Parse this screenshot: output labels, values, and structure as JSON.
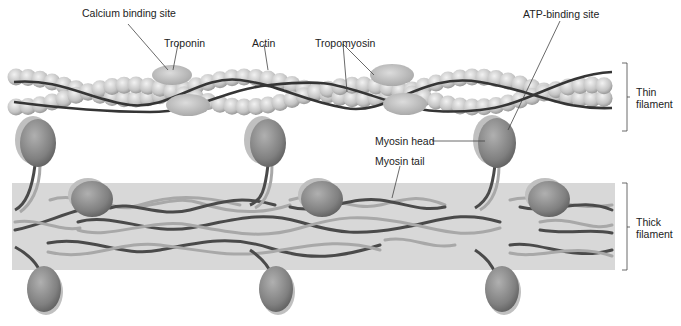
{
  "labels": {
    "calcium_binding_site": "Calcium binding site",
    "troponin": "Troponin",
    "actin": "Actin",
    "tropomyosin": "Tropomyosin",
    "atp_binding_site": "ATP-binding site",
    "myosin_head": "Myosin head",
    "myosin_tail": "Myosin tail",
    "thin_filament_line1": "Thin",
    "thin_filament_line2": "filament",
    "thick_filament_line1": "Thick",
    "thick_filament_line2": "filament"
  },
  "colors": {
    "actin_bead": "#c8c8c8",
    "tropomyosin_strand": "#3a3a3a",
    "troponin": "#bdbdbd",
    "myosin_head": "#8a8a8a",
    "thick_band": "#d6d6d6",
    "tail_dark": "#4a4a4a",
    "tail_light": "#a8a8a8",
    "leader_line": "#444444"
  }
}
